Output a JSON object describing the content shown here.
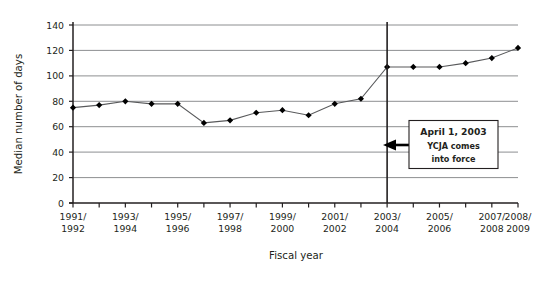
{
  "chart_data": {
    "type": "line",
    "title": "",
    "xlabel": "Fiscal year",
    "ylabel": "Median number of days",
    "ylim": [
      0,
      140
    ],
    "ytick_step": 20,
    "yticks": [
      "0",
      "20",
      "40",
      "60",
      "80",
      "100",
      "120",
      "140"
    ],
    "grid": true,
    "legend": "none",
    "marker": "filled-diamond",
    "line_color": "#58595b",
    "marker_color": "#000000",
    "categories": [
      "1991/\n1992",
      "1992/\n1993",
      "1993/\n1994",
      "1994/\n1995",
      "1995/\n1996",
      "1996/\n1997",
      "1997/\n1998",
      "1998/\n1999",
      "1999/\n2000",
      "2000/\n2001",
      "2001/\n2002",
      "2002/\n2003",
      "2003/\n2004",
      "2004/\n2005",
      "2005/\n2006",
      "2006/\n2007",
      "2007/\n2008",
      "2008/\n2009"
    ],
    "xtick_labels_shown": [
      {
        "index": 0,
        "line1": "1991/",
        "line2": "1992"
      },
      {
        "index": 2,
        "line1": "1993/",
        "line2": "1994"
      },
      {
        "index": 4,
        "line1": "1995/",
        "line2": "1996"
      },
      {
        "index": 6,
        "line1": "1997/",
        "line2": "1998"
      },
      {
        "index": 8,
        "line1": "1999/",
        "line2": "2000"
      },
      {
        "index": 10,
        "line1": "2001/",
        "line2": "2002"
      },
      {
        "index": 12,
        "line1": "2003/",
        "line2": "2004"
      },
      {
        "index": 14,
        "line1": "2005/",
        "line2": "2006"
      },
      {
        "index": 16,
        "line1": "2007/",
        "line2": "2008"
      },
      {
        "index": 17,
        "line1": "2008/",
        "line2": "2009"
      }
    ],
    "values": [
      75,
      77,
      80,
      78,
      78,
      63,
      65,
      71,
      73,
      69,
      78,
      82,
      107,
      107,
      107,
      110,
      114,
      122
    ],
    "series": [
      {
        "name": "Median number of days",
        "values": [
          75,
          77,
          80,
          78,
          78,
          63,
          65,
          71,
          73,
          69,
          78,
          82,
          107,
          107,
          107,
          110,
          114,
          122
        ]
      }
    ],
    "annotations": [
      {
        "name": "ycja-marker",
        "type": "vertical-line",
        "at_category_index": 12,
        "at_category": "2003/2004"
      },
      {
        "name": "ycja-callout",
        "type": "box-with-arrow",
        "line1": "April 1, 2003",
        "line2": "YCJA comes",
        "line3": "into force",
        "arrow_points_to": "2003/2004"
      }
    ]
  }
}
